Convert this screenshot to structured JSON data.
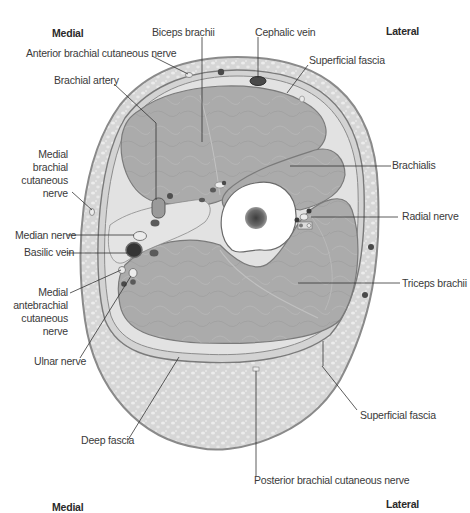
{
  "figure": {
    "orientation": {
      "top_left": "Medial",
      "top_right": "Lateral",
      "bottom_left": "Medial",
      "bottom_right": "Lateral"
    },
    "labels": {
      "biceps_brachii": "Biceps brachii",
      "cephalic_vein": "Cephalic vein",
      "anterior_brachial_cutaneous_nerve": "Anterior brachial cutaneous nerve",
      "superficial_fascia_top": "Superficial fascia",
      "brachial_artery": "Brachial artery",
      "medial_brachial_cutaneous_nerve": [
        "Medial",
        "brachial",
        "cutaneous",
        "nerve"
      ],
      "brachialis": "Brachialis",
      "radial_nerve": "Radial nerve",
      "median_nerve": "Median nerve",
      "basilic_vein": "Basilic vein",
      "medial_antebrachial_cutaneous_nerve": [
        "Medial",
        "antebrachial",
        "cutaneous",
        "nerve"
      ],
      "triceps_brachii": "Triceps brachii",
      "ulnar_nerve": "Ulnar nerve",
      "superficial_fascia_bottom": "Superficial fascia",
      "deep_fascia": "Deep fascia",
      "posterior_brachial_cutaneous_nerve": "Posterior brachial cutaneous nerve"
    },
    "colors": {
      "skin_outline": "#8a8a8a",
      "subcutaneous_fat": "#dcdcdc",
      "muscle": "#a9a9a9",
      "muscle_light": "#bdbdbd",
      "bone_cortex": "#ffffff",
      "bone_marrow": "#555555",
      "vessel_dark": "#4a4a4a",
      "nerve": "#e6e6e6",
      "leader_line": "#333333",
      "text": "#3a3a3a"
    }
  }
}
